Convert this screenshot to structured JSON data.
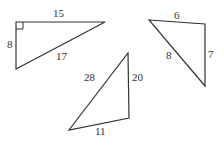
{
  "triangles": [
    {
      "name": "right triangle",
      "right_angle": true,
      "sides": {
        "top": "15",
        "left": "8",
        "hypotenuse": "17"
      }
    },
    {
      "name": "tall triangle",
      "sides": {
        "left": "28",
        "right": "20",
        "bottom": "11"
      }
    },
    {
      "name": "small triangle",
      "sides": {
        "top": "6",
        "right": "7",
        "left": "8"
      }
    }
  ],
  "colors": {
    "stroke": "#333333",
    "background": "#ffffff"
  }
}
